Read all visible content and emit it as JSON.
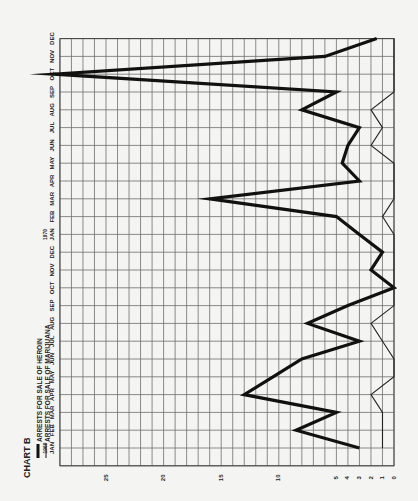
{
  "chart_data": {
    "type": "line",
    "title": "CHART B",
    "orientation": "rotated 90deg counter-clockwise (months run bottom-to-top along the left edge, values run right-to-left along the bottom)",
    "xlabel": "Month",
    "ylabel": "Arrests",
    "ylim": [
      0,
      29
    ],
    "y_ticks": [
      0,
      1,
      2,
      3,
      4,
      5,
      10,
      15,
      20,
      25
    ],
    "grid": true,
    "legend_position": "top-left (rotated)",
    "year_labels": [
      {
        "label": "1969",
        "index": 0
      },
      {
        "label": "1970",
        "index": 12
      }
    ],
    "categories": [
      "JAN",
      "FEB",
      "MAR",
      "APR",
      "MAY",
      "JUN",
      "JUL",
      "AUG",
      "SEP",
      "OCT",
      "NOV",
      "DEC",
      "JAN",
      "FEB",
      "MAR",
      "APR",
      "MAY",
      "JUN",
      "JUL",
      "AUG",
      "SEP",
      "OCT",
      "NOV",
      "DEC"
    ],
    "series": [
      {
        "name": "ARRESTS FOR SALE OF HEROIN",
        "style": "thick",
        "color": "#111111",
        "values": [
          3,
          8.5,
          5,
          13,
          10.5,
          8,
          3,
          7.5,
          4,
          0,
          2,
          1,
          3,
          5,
          16,
          3,
          4.5,
          4,
          3,
          8,
          5,
          29.5,
          6,
          1.5
        ]
      },
      {
        "name": "ARRESTS FOR SALE OF MARIJUANA",
        "style": "thin",
        "color": "#222222",
        "values": [
          1,
          1,
          1,
          2,
          0,
          0,
          1,
          2,
          0,
          0,
          0,
          0,
          0,
          1,
          0,
          0,
          0,
          2,
          1,
          2,
          0,
          0,
          0,
          0
        ]
      }
    ]
  },
  "legend": {
    "title": "CHART B",
    "items": [
      {
        "label": "ARRESTS FOR SALE OF HEROIN",
        "style": "thick"
      },
      {
        "label": "ARRESTS FOR SALE OF MARIJUANA",
        "style": "thin"
      }
    ]
  },
  "colors": {
    "background": "#f4f4f2",
    "grid": "#6e6e6e",
    "ink": "#111111"
  }
}
